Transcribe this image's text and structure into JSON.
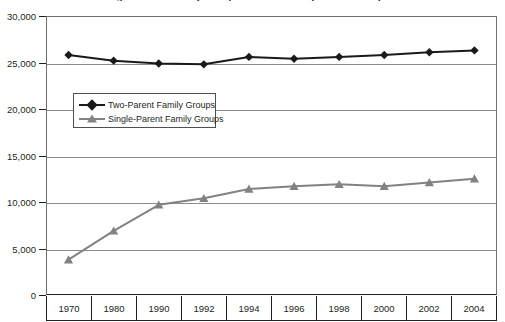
{
  "chart_data": {
    "type": "line",
    "title": "Two-Parent and Single-Parent Family Groups with Children (in thousands)",
    "xlabel": "",
    "ylabel": "",
    "ylim": [
      0,
      30000
    ],
    "ytick_labels": [
      "30,000",
      "25,000",
      "20,000",
      "15,000",
      "10,000",
      "5,000",
      "0"
    ],
    "ytick_values": [
      30000,
      25000,
      20000,
      15000,
      10000,
      5000,
      0
    ],
    "grid": "horizontal",
    "legend_position": "upper-left-inset",
    "categories": [
      "1970",
      "1980",
      "1990",
      "1992",
      "1994",
      "1996",
      "1998",
      "2000",
      "2002",
      "2004"
    ],
    "series": [
      {
        "name": "Two-Parent Family Groups",
        "color": "#1a1a1a",
        "marker": "diamond",
        "values": [
          25800,
          25200,
          24900,
          24800,
          25600,
          25400,
          25600,
          25800,
          26100,
          26300
        ]
      },
      {
        "name": "Single-Parent Family Groups",
        "color": "#808285",
        "marker": "triangle",
        "values": [
          3800,
          6900,
          9700,
          10400,
          11400,
          11700,
          11900,
          11700,
          12100,
          12500
        ]
      }
    ]
  },
  "legend": {
    "items": [
      {
        "label": "Two-Parent Family Groups"
      },
      {
        "label": "Single-Parent Family Groups"
      }
    ]
  },
  "colors": {
    "two_parent": "#1a1a1a",
    "single_parent": "#808285",
    "axis": "#231f20",
    "grid": "#8a8c8e",
    "background": "#ffffff"
  }
}
